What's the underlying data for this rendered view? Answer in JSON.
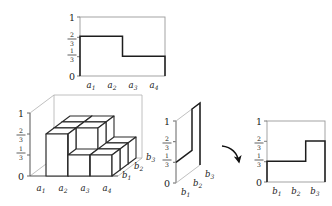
{
  "figure": {
    "axis_color": "#8e8e8e",
    "profile_color": "#1d1d1d",
    "cube_edge_color": "#2b2b2b",
    "cube_face_color": "#ffffff",
    "guide_color": "#a8a8a8",
    "arrow_color": "#111111"
  },
  "panels": {
    "top_profile": {
      "name": "a-profile-chart",
      "y_ticks": [
        "1",
        "2/3",
        "1/3",
        "0"
      ],
      "y_tick_values": [
        1,
        0.6667,
        0.3333,
        0
      ],
      "x_labels": [
        "a1",
        "a2",
        "a3",
        "a4"
      ],
      "x_labels_tex": [
        {
          "base": "a",
          "sub": "1"
        },
        {
          "base": "a",
          "sub": "2"
        },
        {
          "base": "a",
          "sub": "3"
        },
        {
          "base": "a",
          "sub": "4"
        }
      ],
      "step_values": [
        0.6667,
        0.6667,
        0.3333,
        0.3333
      ]
    },
    "blocks_3d": {
      "name": "block-stack-3d",
      "y_ticks": [
        "1",
        "2/3",
        "1/3",
        "0"
      ],
      "y_tick_values": [
        1,
        0.6667,
        0.3333,
        0
      ],
      "x_labels_tex": [
        {
          "base": "a",
          "sub": "1"
        },
        {
          "base": "a",
          "sub": "2"
        },
        {
          "base": "a",
          "sub": "3"
        },
        {
          "base": "a",
          "sub": "4"
        }
      ],
      "depth_labels_tex": [
        {
          "base": "b",
          "sub": "1"
        },
        {
          "base": "b",
          "sub": "2"
        },
        {
          "base": "b",
          "sub": "3"
        }
      ],
      "column_heights": [
        [
          1,
          2,
          3
        ],
        [
          1,
          2,
          3
        ],
        [
          1,
          1,
          2
        ],
        [
          1,
          1,
          2
        ]
      ]
    },
    "skewed_plane": {
      "name": "skewed-projection-panel",
      "y_ticks": [
        "1",
        "2/3",
        "1/3",
        "0"
      ],
      "y_tick_values": [
        1,
        0.6667,
        0.3333,
        0
      ],
      "depth_labels_tex": [
        {
          "base": "b",
          "sub": "1"
        },
        {
          "base": "b",
          "sub": "2"
        },
        {
          "base": "b",
          "sub": "3"
        }
      ],
      "step_values": [
        0.3333,
        0.3333,
        1.0
      ]
    },
    "arrow": {
      "name": "transform-arrow",
      "label": ""
    },
    "right_profile": {
      "name": "b-profile-chart",
      "y_ticks": [
        "1",
        "2/3",
        "1/3",
        "0"
      ],
      "y_tick_values": [
        1,
        0.6667,
        0.3333,
        0
      ],
      "x_labels_tex": [
        {
          "base": "b",
          "sub": "1"
        },
        {
          "base": "b",
          "sub": "2"
        },
        {
          "base": "b",
          "sub": "3"
        }
      ],
      "step_values": [
        0.3333,
        0.3333,
        0.6667
      ]
    }
  }
}
